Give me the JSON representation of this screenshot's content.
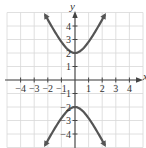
{
  "chart_data": {
    "type": "line",
    "title": "",
    "xlabel": "x",
    "ylabel": "y",
    "xlim": [
      -5,
      5
    ],
    "ylim": [
      -5,
      5
    ],
    "grid": true,
    "equation": "y^2/4 - x^2 = 1",
    "x_ticks": [
      -4,
      -3,
      -2,
      -1,
      1,
      2,
      3,
      4
    ],
    "y_ticks": [
      -4,
      -3,
      -2,
      -1,
      1,
      2,
      3,
      4
    ],
    "x_tick_labels": [
      "−4",
      "−3",
      "−2",
      "−1",
      "1",
      "2",
      "3",
      "4"
    ],
    "y_tick_labels": [
      "−4",
      "−3",
      "−2",
      "−1",
      "1",
      "2",
      "3",
      "4"
    ],
    "series": [
      {
        "name": "upper branch",
        "x": [
          -2.2,
          -2.0,
          -1.5,
          -1.0,
          -0.5,
          0,
          0.5,
          1.0,
          1.5,
          2.0,
          2.2
        ],
        "y": [
          4.83,
          4.47,
          3.61,
          2.83,
          2.24,
          2.0,
          2.24,
          2.83,
          3.61,
          4.47,
          4.83
        ]
      },
      {
        "name": "lower branch",
        "x": [
          -2.2,
          -2.0,
          -1.5,
          -1.0,
          -0.5,
          0,
          0.5,
          1.0,
          1.5,
          2.0,
          2.2
        ],
        "y": [
          -4.83,
          -4.47,
          -3.61,
          -2.83,
          -2.24,
          -2.0,
          -2.24,
          -2.83,
          -3.61,
          -4.47,
          -4.83
        ]
      }
    ],
    "vertices": [
      [
        0,
        2
      ],
      [
        0,
        -2
      ]
    ],
    "colors": {
      "curve": "#555555",
      "axis": "#444444",
      "grid": "#d8d8d8"
    }
  }
}
